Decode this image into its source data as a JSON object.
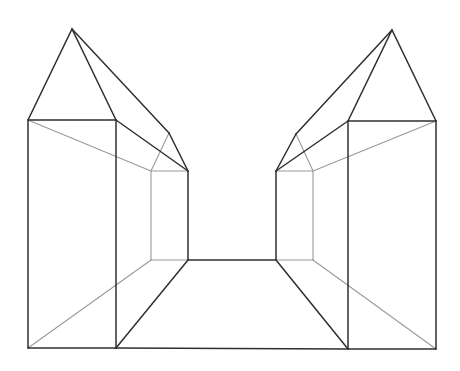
{
  "diagram": {
    "title": "",
    "colors": {
      "background": "#ffffff",
      "dark_line": "#2f2f2f",
      "light_line": "#9a9a9a"
    },
    "left_house": {
      "apex": [
        72,
        29
      ],
      "eave_left": [
        28,
        120
      ],
      "front_right_top": [
        116,
        120
      ],
      "roof_back": [
        169,
        133
      ],
      "far_top": [
        188,
        171
      ],
      "inner_back_top": [
        151,
        171
      ],
      "bottom_left": [
        28,
        348
      ],
      "front_right_bottom": [
        116,
        348
      ],
      "far_bottom": [
        188,
        260
      ],
      "inner_back_bottom": [
        151,
        260
      ]
    },
    "right_house": {
      "apex": [
        392,
        30
      ],
      "eave_right": [
        436,
        121
      ],
      "front_left_top": [
        348,
        121
      ],
      "roof_back": [
        296,
        134
      ],
      "far_top": [
        276,
        171
      ],
      "inner_back_top": [
        313,
        171
      ],
      "bottom_right": [
        436,
        349
      ],
      "front_left_bottom": [
        348,
        349
      ],
      "far_bottom": [
        276,
        260
      ],
      "inner_back_bottom": [
        313,
        260
      ]
    }
  }
}
